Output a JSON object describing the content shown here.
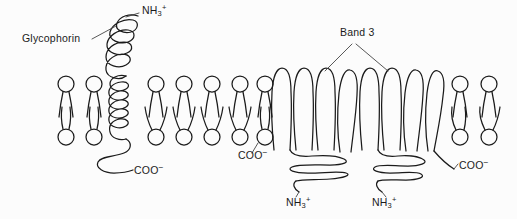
{
  "figure": {
    "background_color": "#fcfcfc",
    "ink_color": "#1b1b1b",
    "width": 517,
    "height": 219
  },
  "labels": {
    "glycophorin": "Glycophorin",
    "band3": "Band 3",
    "amino_terminus": "NH",
    "amino_sub": "3",
    "amino_charge": "+",
    "carboxy_terminus": "COO",
    "carboxy_charge": "−"
  },
  "annotations": [
    {
      "id": "glycophorin-label",
      "text": "Glycophorin",
      "x": 22,
      "y": 39,
      "leader": true
    },
    {
      "id": "band3-label",
      "text": "Band 3",
      "x": 340,
      "y": 33,
      "leader": true
    },
    {
      "id": "nh3-glycophorin",
      "text": "NH3+",
      "x": 142,
      "y": 7,
      "leader": true
    },
    {
      "id": "coo-glycophorin",
      "text": "COO−",
      "x": 134,
      "y": 169,
      "leader": false
    },
    {
      "id": "coo-band3-left",
      "text": "COO−",
      "x": 238,
      "y": 153,
      "leader": true
    },
    {
      "id": "nh3-band3-left",
      "text": "NH3+",
      "x": 286,
      "y": 195,
      "leader": true
    },
    {
      "id": "nh3-band3-right",
      "text": "NH3+",
      "x": 372,
      "y": 195,
      "leader": true
    },
    {
      "id": "coo-band3-right",
      "text": "COO−",
      "x": 455,
      "y": 159,
      "leader": true
    }
  ],
  "membrane": {
    "description": "phospholipid bilayer",
    "upper_leaflet_head_y": 88,
    "lower_leaflet_head_y": 132,
    "lipid_count_upper": 12,
    "lipid_count_lower": 12
  },
  "proteins": [
    {
      "name": "Glycophorin",
      "type": "single-pass transmembrane",
      "n_terminus": "NH3+",
      "c_terminus": "COO−",
      "passes": 1
    },
    {
      "name": "Band 3",
      "type": "multi-pass transmembrane",
      "n_terminus": "NH3+",
      "c_terminus": "COO−",
      "passes": 12,
      "domains": 2
    }
  ]
}
